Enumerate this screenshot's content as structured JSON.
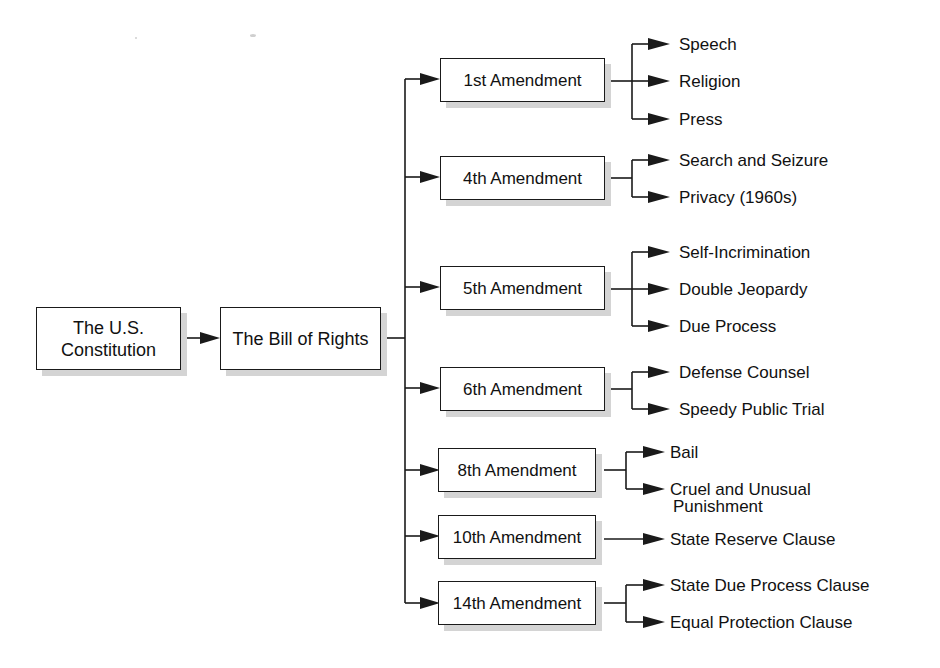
{
  "diagram": {
    "type": "hierarchy-flowchart",
    "root": {
      "label": "The U.S. Constitution",
      "line1": "The U.S.",
      "line2": "Constitution"
    },
    "level1": {
      "label": "The Bill of Rights"
    },
    "amendments": [
      {
        "label": "1st Amendment",
        "rights": [
          "Speech",
          "Religion",
          "Press"
        ]
      },
      {
        "label": "4th Amendment",
        "rights": [
          "Search and Seizure",
          "Privacy (1960s)"
        ]
      },
      {
        "label": "5th Amendment",
        "rights": [
          "Self-Incrimination",
          "Double Jeopardy",
          "Due Process"
        ]
      },
      {
        "label": "6th Amendment",
        "rights": [
          "Defense Counsel",
          "Speedy Public Trial"
        ]
      },
      {
        "label": "8th Amendment",
        "rights": [
          "Bail",
          "Cruel and Unusual Punishment"
        ],
        "rights_display": [
          "Bail",
          "Cruel and Unusual",
          "Punishment"
        ]
      },
      {
        "label": "10th Amendment",
        "rights": [
          "State Reserve Clause"
        ]
      },
      {
        "label": "14th Amendment",
        "rights": [
          "State Due Process Clause",
          "Equal Protection Clause"
        ]
      }
    ]
  },
  "colors": {
    "line": "#1a1a1a",
    "shadow": "#d4d4d4",
    "background": "#ffffff"
  }
}
